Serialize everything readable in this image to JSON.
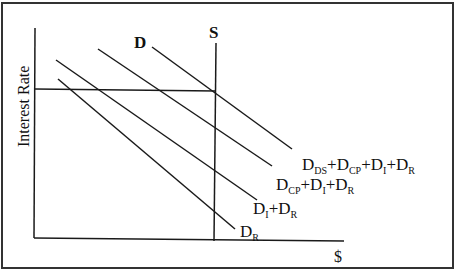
{
  "diagram": {
    "type": "supply-demand",
    "y_axis_label": "Interest Rate",
    "x_axis_label": "$",
    "supply_label": "S",
    "demand_top_label": "D",
    "curves": [
      {
        "id": "dr",
        "label_parts": [
          [
            "D",
            ""
          ],
          [
            "R",
            "sub"
          ]
        ],
        "from": [
          58,
          79
        ],
        "to": [
          235,
          229
        ]
      },
      {
        "id": "di_dr",
        "label_parts": [
          [
            "D",
            ""
          ],
          [
            "I",
            "sub"
          ],
          [
            "+D",
            ""
          ],
          [
            "R",
            "sub"
          ]
        ],
        "from": [
          56,
          60
        ],
        "to": [
          257,
          200
        ]
      },
      {
        "id": "dcp_di_dr",
        "label_parts": [
          [
            "D",
            ""
          ],
          [
            "CP",
            "sub"
          ],
          [
            "+D",
            ""
          ],
          [
            "I",
            "sub"
          ],
          [
            "+D",
            ""
          ],
          [
            "R",
            "sub"
          ]
        ],
        "from": [
          98,
          49
        ],
        "to": [
          272,
          166
        ]
      },
      {
        "id": "dds_dcp_di_dr",
        "label_parts": [
          [
            "D",
            ""
          ],
          [
            "DS",
            "sub"
          ],
          [
            "+D",
            ""
          ],
          [
            "CP",
            "sub"
          ],
          [
            "+D",
            ""
          ],
          [
            "I",
            "sub"
          ],
          [
            "+D",
            ""
          ],
          [
            "R",
            "sub"
          ]
        ],
        "from": [
          152,
          47
        ],
        "to": [
          292,
          149
        ]
      }
    ],
    "labels": {
      "dr": "DR",
      "di_dr": "DI+DR",
      "dcp_di_dr": "DCP+DI+DR",
      "dds_dcp_di_dr": "DDS+DCP+DI+DR"
    },
    "colors": {
      "line": "#1a1a1a",
      "background": "#ffffff"
    }
  }
}
